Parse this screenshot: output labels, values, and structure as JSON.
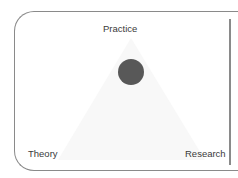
{
  "diagram": {
    "type": "ternary-position",
    "vertices": {
      "top": "Practice",
      "bottom_left": "Theory",
      "bottom_right": "Research"
    },
    "marker": {
      "shape": "circle",
      "color": "#585858",
      "position_hint": "near Practice apex, centered horizontally"
    },
    "colors": {
      "border": "#8a8a8a",
      "text": "#3a3a3a",
      "triangle_fill": "#f7f7f7",
      "background": "#ffffff"
    }
  }
}
